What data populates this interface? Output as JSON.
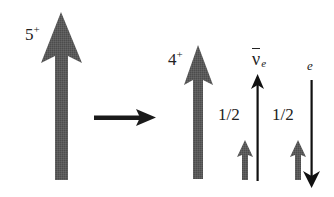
{
  "diagram": {
    "initial_state": {
      "label": "5",
      "parity": "+",
      "spin_value": 5,
      "arrow": {
        "direction": "up",
        "size": "large",
        "color": "#5a5a5a"
      }
    },
    "transition_arrow": {
      "direction": "right",
      "color": "#1a1a1a"
    },
    "final_state": {
      "nucleus": {
        "label": "4",
        "parity": "+",
        "spin_value": 4,
        "arrow": {
          "direction": "up",
          "size": "medium",
          "color": "#5a5a5a"
        }
      },
      "antineutrino": {
        "symbol": "ν",
        "subscript": "e",
        "overbar": true,
        "spin_label": "1/2",
        "spin_arrow": {
          "direction": "up",
          "size": "small",
          "color": "#5a5a5a"
        },
        "momentum_arrow": {
          "direction": "up",
          "color": "#111111"
        }
      },
      "electron": {
        "symbol": "e",
        "spin_label": "1/2",
        "spin_arrow": {
          "direction": "up",
          "size": "small",
          "color": "#5a5a5a"
        },
        "momentum_arrow": {
          "direction": "down",
          "color": "#111111"
        }
      }
    }
  }
}
